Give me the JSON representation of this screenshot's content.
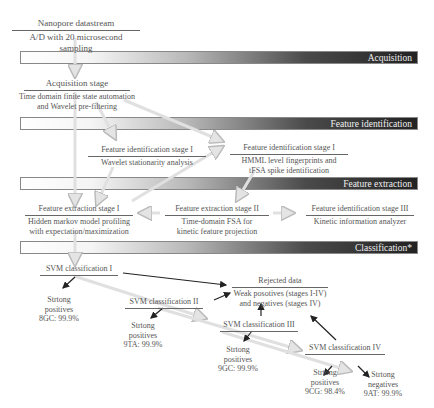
{
  "bands": [
    {
      "label": "Acquisition"
    },
    {
      "label": "Feature identification"
    },
    {
      "label": "Feature extraction"
    },
    {
      "label": "Classification*"
    }
  ],
  "nodes": {
    "datastream": {
      "title": "Nanopore datastream",
      "body": "A/D with 20 microsecond sampling"
    },
    "acquisition": {
      "title": "Acquisition stage",
      "body_line1": "Time domain finite state automation",
      "body_line2": "and Wavelet pre-filtering"
    },
    "fid_wavelet": {
      "title": "Feature identification stage I",
      "body": "Wavelet stationarity analysis"
    },
    "fid_hmm": {
      "title": "Feature identification stage I",
      "body_line1": "HMML level fingerprints and",
      "body_line2": "tFSA spike identification"
    },
    "fex_1": {
      "title": "Feature extraction stage I",
      "body_line1": "Hidden markov model profiling",
      "body_line2": "with expectation/maximization"
    },
    "fex_2": {
      "title": "Feature extraction stage II",
      "body_line1": "Time-domain FSA for",
      "body_line2": "kinetic feature projection"
    },
    "fid_3": {
      "title": "Feature identification stage III",
      "body": "Kinetic information analyzer"
    },
    "rejected": {
      "title": "Rejected data",
      "body_line1": "Weak posotives (stages I-IV)",
      "body_line2": "and negatives (stages IV)"
    },
    "svm1": {
      "title": "SVM classification I"
    },
    "svm2": {
      "title": "SVM classification II"
    },
    "svm3": {
      "title": "SVM classification III"
    },
    "svm4": {
      "title": "SVM classification IV"
    },
    "res1": {
      "line1": "Strtong",
      "line2": "positives",
      "line3": "8GC: 99.9%"
    },
    "res2": {
      "line1": "Strtong",
      "line2": "positives",
      "line3": "9TA: 99.9%"
    },
    "res3": {
      "line1": "Strtong",
      "line2": "positives",
      "line3": "9GC: 99.9%"
    },
    "res4": {
      "line1": "Strtong",
      "line2": "positives",
      "line3": "9CG: 98.4%"
    },
    "res5": {
      "line1": "Strtong",
      "line2": "negatives",
      "line3": "9AT: 99.9%"
    }
  },
  "colors": {
    "hollow_arrow": "#d8d8d8",
    "solid_arrow": "#222222",
    "band_dark": "#222222"
  }
}
